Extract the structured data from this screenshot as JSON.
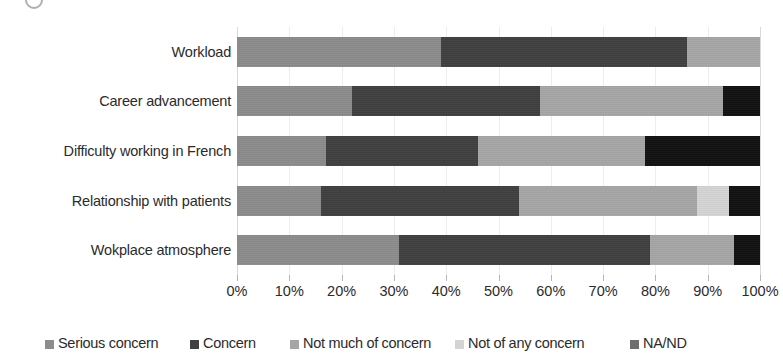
{
  "chart_data": {
    "type": "bar",
    "orientation": "horizontal",
    "stacked": true,
    "normalized_percent": true,
    "title": "",
    "subtitle": "",
    "xlabel": "",
    "ylabel": "",
    "xlim": [
      0,
      100
    ],
    "xticks": [
      0,
      10,
      20,
      30,
      40,
      50,
      60,
      70,
      80,
      90,
      100
    ],
    "xtick_labels": [
      "0%",
      "10%",
      "20%",
      "30%",
      "40%",
      "50%",
      "60%",
      "70%",
      "80%",
      "90%",
      "100%"
    ],
    "grid": true,
    "grid_axis": "x",
    "legend_position": "bottom",
    "categories": [
      "Workload",
      "Career advancement",
      "Difficulty working in French",
      "Relationship with patients",
      "Wokplace atmosphere"
    ],
    "series": [
      {
        "name": "Serious concern",
        "color": "#8c8c8c",
        "values": [
          39,
          22,
          17,
          16,
          31
        ]
      },
      {
        "name": "Concern",
        "color": "#404040",
        "values": [
          47,
          36,
          29,
          38,
          48
        ]
      },
      {
        "name": "Not much of concern",
        "color": "#a6a6a6",
        "values": [
          14,
          35,
          32,
          34,
          16
        ]
      },
      {
        "name": "Not of any concern",
        "color": "#d4d4d4",
        "values": [
          0,
          0,
          0,
          6,
          0
        ]
      },
      {
        "name": "NA/ND",
        "color": "#111111",
        "values": [
          0,
          7,
          22,
          6,
          5
        ]
      }
    ]
  },
  "legend": {
    "items": [
      {
        "label": "Serious concern",
        "color": "#8c8c8c"
      },
      {
        "label": "Concern",
        "color": "#404040"
      },
      {
        "label": "Not much of concern",
        "color": "#a6a6a6"
      },
      {
        "label": "Not of any concern",
        "color": "#d4d4d4"
      },
      {
        "label": "NA/ND",
        "color": "#6e6e6e"
      }
    ]
  }
}
